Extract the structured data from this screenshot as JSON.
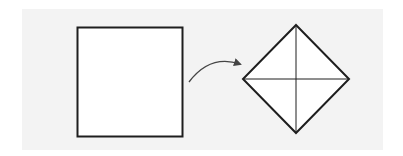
{
  "diagram": {
    "colors": {
      "background": "#ffffff",
      "panel": "#f3f3f3",
      "stroke": "#1e1e1e",
      "fill": "#ffffff",
      "arrow": "#444444"
    },
    "shapes": [
      {
        "id": "square",
        "type": "square",
        "x": 77,
        "y": 27,
        "width": 106,
        "height": 110
      },
      {
        "id": "diamond",
        "type": "diamond",
        "center": [
          296,
          79
        ],
        "half_width": 53,
        "half_height": 54,
        "diagonals": true
      }
    ],
    "arrow": {
      "from": [
        189,
        82
      ],
      "to": [
        242,
        64
      ],
      "curved": true
    }
  }
}
